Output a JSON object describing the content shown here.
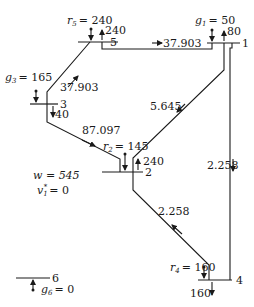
{
  "diagram": {
    "type": "power-network",
    "buses": [
      {
        "id": "1",
        "label": "1",
        "gen_label": "g",
        "gen_index": "1",
        "gen_value": "= 50",
        "arrow_value": "80"
      },
      {
        "id": "2",
        "label": "2",
        "gen_label": "r",
        "gen_index": "2",
        "gen_value": "= 145",
        "arrow_value": "240"
      },
      {
        "id": "3",
        "label": "3",
        "gen_label": "g",
        "gen_index": "3",
        "gen_value": "= 165",
        "arrow_value": "40"
      },
      {
        "id": "4",
        "label": "4",
        "gen_label": "r",
        "gen_index": "4",
        "gen_value": "= 160",
        "arrow_value": "160"
      },
      {
        "id": "5",
        "label": "5",
        "gen_label": "r",
        "gen_index": "5",
        "gen_value": "= 240",
        "arrow_value": "240"
      },
      {
        "id": "6",
        "label": "6",
        "gen_label": "g",
        "gen_index": "6",
        "gen_value": "= 0"
      }
    ],
    "flows": [
      {
        "from": "5",
        "to": "1",
        "value": "37.903"
      },
      {
        "from": "3",
        "to": "5",
        "value": "37.903"
      },
      {
        "from": "3",
        "to": "2",
        "value": "87.097"
      },
      {
        "from": "1",
        "to": "2",
        "value": "5.645"
      },
      {
        "from": "1",
        "to": "4",
        "value": "2.258"
      },
      {
        "from": "4",
        "to": "2",
        "value": "2.258"
      }
    ],
    "summary": {
      "w_label": "w = 545",
      "v_label": "v",
      "v_sub": "1",
      "v_sup": "*",
      "v_value": "= 0"
    }
  }
}
